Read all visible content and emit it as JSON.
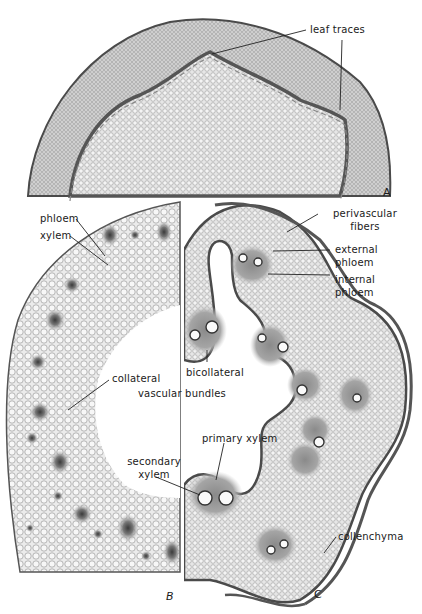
{
  "figure": {
    "panels": [
      {
        "id": "A",
        "letter": "A",
        "description": "stem cross-section with leaf traces"
      },
      {
        "id": "B",
        "letter": "B",
        "description": "stem section with collateral vascular bundles"
      },
      {
        "id": "C",
        "letter": "C",
        "description": "stem section with bicollateral vascular bundles"
      }
    ],
    "labels": {
      "leaf_traces": "leaf traces",
      "phloem": "phloem",
      "xylem": "xylem",
      "collateral": "collateral",
      "vascular_bundles": "vascular bundles",
      "bicollateral": "bicollateral",
      "perivascular_1": "perivascular",
      "perivascular_2": "fibers",
      "external_1": "external",
      "external_2": "phloem",
      "internal_1": "internal",
      "internal_2": "phloem",
      "primary_xylem": "primary xylem",
      "secondary_1": "secondary",
      "secondary_2": "xylem",
      "collenchyma": "collenchyma"
    },
    "colors": {
      "tissue_light": "#d8d8d8",
      "tissue_mid": "#a8a8a8",
      "tissue_dark": "#555555",
      "background": "#ffffff",
      "text": "#1a1a1a"
    }
  }
}
